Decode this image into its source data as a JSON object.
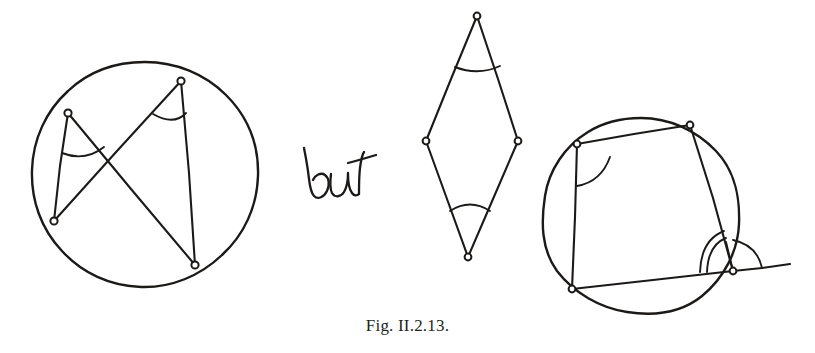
{
  "figure": {
    "caption": "Fig. II.2.13.",
    "connector_text": "but",
    "ink_color": "#1c1a18",
    "background_color": "#ffffff",
    "panels": [
      {
        "name": "cyclic-quadrilateral-equal-angles",
        "kind": "circle-with-inscribed-quadrilateral",
        "circle": {
          "cx": 145,
          "cy": 175,
          "r": 113
        },
        "vertices": [
          {
            "label": "upper-left",
            "x": 68,
            "y": 113
          },
          {
            "label": "top",
            "x": 181,
            "y": 81
          },
          {
            "label": "lower-left",
            "x": 54,
            "y": 221
          },
          {
            "label": "bottom-right",
            "x": 195,
            "y": 265
          }
        ],
        "segments": [
          {
            "from": "upper-left",
            "to": "lower-left"
          },
          {
            "from": "upper-left",
            "to": "bottom-right"
          },
          {
            "from": "top",
            "to": "lower-left"
          },
          {
            "from": "top",
            "to": "bottom-right"
          }
        ],
        "marked_angles": [
          {
            "at": "upper-left",
            "marks": 1
          },
          {
            "at": "top",
            "marks": 1
          }
        ]
      },
      {
        "name": "rhombus-equal-angles",
        "kind": "quadrilateral-without-circle",
        "vertices": [
          {
            "label": "top",
            "x": 477,
            "y": 16
          },
          {
            "label": "left",
            "x": 426,
            "y": 141
          },
          {
            "label": "right",
            "x": 518,
            "y": 141
          },
          {
            "label": "bottom",
            "x": 468,
            "y": 257
          }
        ],
        "segments": [
          {
            "from": "top",
            "to": "left"
          },
          {
            "from": "top",
            "to": "right"
          },
          {
            "from": "left",
            "to": "bottom"
          },
          {
            "from": "right",
            "to": "bottom"
          }
        ],
        "marked_angles": [
          {
            "at": "top",
            "marks": 1
          },
          {
            "at": "bottom",
            "marks": 1
          }
        ]
      },
      {
        "name": "cyclic-quadrilateral-exterior-angle",
        "kind": "circle-with-inscribed-quadrilateral-and-extended-side",
        "circle": {
          "cx": 641,
          "cy": 216,
          "r": 98
        },
        "vertices": [
          {
            "label": "top-left",
            "x": 577,
            "y": 144
          },
          {
            "label": "top-right",
            "x": 690,
            "y": 125
          },
          {
            "label": "bottom-left",
            "x": 572,
            "y": 289
          },
          {
            "label": "bottom-right",
            "x": 733,
            "y": 271
          }
        ],
        "segments": [
          {
            "from": "top-left",
            "to": "top-right"
          },
          {
            "from": "top-left",
            "to": "bottom-left"
          },
          {
            "from": "top-right",
            "to": "bottom-right"
          },
          {
            "from": "bottom-left",
            "to": "bottom-right"
          }
        ],
        "extended_side": {
          "from": "bottom-left",
          "through": "bottom-right",
          "to_x": 790,
          "to_y": 264
        },
        "marked_angles": [
          {
            "at": "top-left",
            "marks": 1
          },
          {
            "at": "bottom-right",
            "marks": 2,
            "type": "interior"
          },
          {
            "at": "bottom-right",
            "marks": 1,
            "type": "exterior"
          }
        ]
      }
    ]
  }
}
